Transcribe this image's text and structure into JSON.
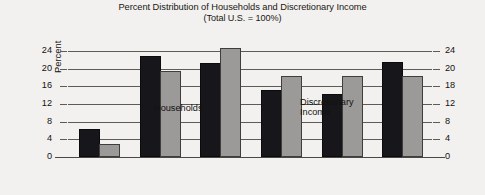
{
  "title": {
    "line1": "Percent Distribution of Households and Discretionary Income",
    "line2": "(Total U.S. = 100%)"
  },
  "axes": {
    "ylabel": "Percent",
    "left_ticks": [
      "24",
      "20",
      "16",
      "12",
      "8",
      "4",
      "0"
    ],
    "right_ticks": [
      "24",
      "20",
      "18",
      "12",
      "8",
      "4",
      "0"
    ]
  },
  "annotations": {
    "households": "Households",
    "discretionary": "Discretionary\nIncome"
  },
  "colors": {
    "households": "#17161a",
    "discretionary": "#9b9a98",
    "background": "#f2f1ef",
    "gridline": "#5d5b58"
  },
  "chart_data": {
    "type": "bar",
    "title": "Percent Distribution of Households and Discretionary Income (Total U.S. = 100%)",
    "xlabel": "",
    "ylabel": "Percent",
    "ylim": [
      0,
      24
    ],
    "yticks": [
      0,
      4,
      8,
      12,
      16,
      20,
      24
    ],
    "grid": true,
    "legend": "inline annotations",
    "categories": [
      "Under 25",
      "25-34",
      "35-44",
      "45-54",
      "55-64",
      "65 & over"
    ],
    "series": [
      {
        "name": "Households",
        "values": [
          6.0,
          22.5,
          20.8,
          14.7,
          13.8,
          21.0
        ]
      },
      {
        "name": "Discretionary Income",
        "values": [
          2.5,
          19.0,
          24.3,
          18.0,
          17.8,
          17.8
        ]
      }
    ]
  }
}
